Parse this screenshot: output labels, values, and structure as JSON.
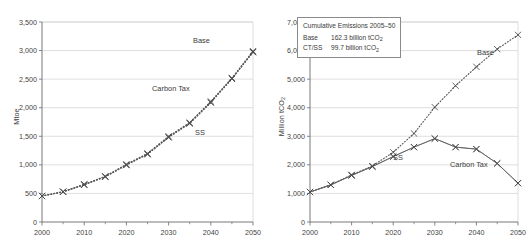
{
  "figure": {
    "panels": [
      {
        "id": "primary-energy",
        "ylabel": "Mtoe",
        "ylabel_sub": "",
        "series_labels": [
          {
            "name": "base-label",
            "text": "Base"
          },
          {
            "name": "carbon-tax-label",
            "text": "Carbon Tax"
          },
          {
            "name": "ss-label",
            "text": "SS"
          }
        ]
      },
      {
        "id": "emissions",
        "ylabel": "Million tCO",
        "ylabel_sub": "2",
        "series_labels": [
          {
            "name": "base-label",
            "text": "Base"
          },
          {
            "name": "carbon-tax-label",
            "text": "Carbon Tax"
          },
          {
            "name": "ss-label",
            "text": "SS"
          }
        ],
        "legend": {
          "title": "Cumulative Emissions 2005–50",
          "rows": [
            {
              "key": "Base",
              "value": "162.3 billion tCO",
              "sub": "2"
            },
            {
              "key": "CT/SS",
              "value": "99.7 billion tCO",
              "sub": "2"
            }
          ]
        }
      }
    ]
  },
  "chart_data": [
    {
      "type": "line",
      "id": "primary-energy",
      "title": "",
      "xlabel": "",
      "ylabel": "Mtoe",
      "xlim": [
        2000,
        2050
      ],
      "ylim": [
        0,
        3500
      ],
      "ytick_labels": [
        "0",
        "500",
        "1,000",
        "1,500",
        "2,000",
        "2,500",
        "3,000",
        "3,500"
      ],
      "ytick_values": [
        0,
        500,
        1000,
        1500,
        2000,
        2500,
        3000,
        3500
      ],
      "xtick_labels": [
        "2000",
        "2010",
        "2020",
        "2030",
        "2040",
        "2050"
      ],
      "xtick_values": [
        2000,
        2010,
        2020,
        2030,
        2040,
        2050
      ],
      "xminor_values": [
        2005,
        2015,
        2025,
        2035,
        2045
      ],
      "grid": "horizontal",
      "legend": "inline-annotations",
      "x": [
        2000,
        2005,
        2010,
        2015,
        2020,
        2025,
        2030,
        2035,
        2040,
        2045,
        2050
      ],
      "series": [
        {
          "name": "Base",
          "style": "dotted-x",
          "values": [
            455,
            530,
            660,
            800,
            1010,
            1200,
            1500,
            1740,
            2110,
            2520,
            2990
          ]
        },
        {
          "name": "Carbon Tax",
          "style": "dotted-x",
          "values": [
            455,
            530,
            655,
            795,
            1000,
            1190,
            1485,
            1730,
            2095,
            2510,
            2975
          ]
        },
        {
          "name": "SS",
          "style": "dotted-x",
          "values": [
            455,
            528,
            650,
            790,
            995,
            1185,
            1480,
            1725,
            2090,
            2505,
            2970
          ]
        }
      ]
    },
    {
      "type": "line",
      "id": "emissions",
      "title": "",
      "xlabel": "",
      "ylabel": "Million tCO2",
      "xlim": [
        2000,
        2050
      ],
      "ylim": [
        0,
        7000
      ],
      "ytick_labels": [
        "0",
        "1,000",
        "2,000",
        "3,000",
        "4,000",
        "5,000",
        "6,000",
        "7,000"
      ],
      "ytick_values": [
        0,
        1000,
        2000,
        3000,
        4000,
        5000,
        6000,
        7000
      ],
      "xtick_labels": [
        "2000",
        "2010",
        "2020",
        "2030",
        "2040",
        "2050"
      ],
      "xtick_values": [
        2000,
        2010,
        2020,
        2030,
        2040,
        2050
      ],
      "xminor_values": [
        2005,
        2015,
        2025,
        2035,
        2045
      ],
      "grid": "horizontal",
      "legend": "box-top-left",
      "x": [
        2000,
        2005,
        2010,
        2015,
        2020,
        2025,
        2030,
        2035,
        2040,
        2045,
        2050
      ],
      "series": [
        {
          "name": "Base",
          "style": "dotted-x",
          "values": [
            1050,
            1300,
            1650,
            1960,
            2440,
            3100,
            4020,
            4770,
            5430,
            6050,
            6550
          ]
        },
        {
          "name": "Carbon Tax",
          "style": "solid-x",
          "values": [
            1050,
            1300,
            1630,
            1940,
            2290,
            2620,
            2920,
            2620,
            2550,
            2050,
            1360
          ]
        },
        {
          "name": "SS",
          "style": "solid-x",
          "values": [
            1050,
            1300,
            1630,
            1940,
            2290,
            2620,
            2920,
            2620,
            2550,
            2050,
            1360
          ]
        }
      ]
    }
  ]
}
